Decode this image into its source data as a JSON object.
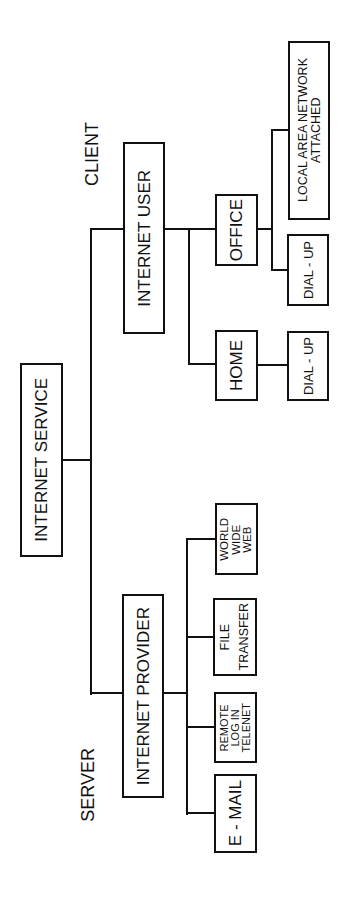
{
  "diagram": {
    "orientation": "rotated-90-ccw",
    "labels": {
      "client": "CLIENT",
      "server": "SERVER"
    },
    "root": {
      "label": "INTERNET SERVICE"
    },
    "client_branch": {
      "label": "INTERNET USER",
      "children": [
        {
          "label": "OFFICE",
          "children": [
            {
              "label": "LOCAL AREA NETWORK\nATTACHED"
            },
            {
              "label": "DIAL - UP"
            }
          ]
        },
        {
          "label": "HOME",
          "children": [
            {
              "label": "DIAL - UP"
            }
          ]
        }
      ]
    },
    "server_branch": {
      "label": "INTERNET PROVIDER",
      "children": [
        {
          "label": "WORLD\nWIDE\nWEB"
        },
        {
          "label": "FILE\nTRANSFER"
        },
        {
          "label": "REMOTE\nLOG IN\nTELENET"
        },
        {
          "label": "E - MAIL"
        }
      ]
    },
    "colors": {
      "line": "#111111",
      "background": "#ffffff"
    }
  }
}
